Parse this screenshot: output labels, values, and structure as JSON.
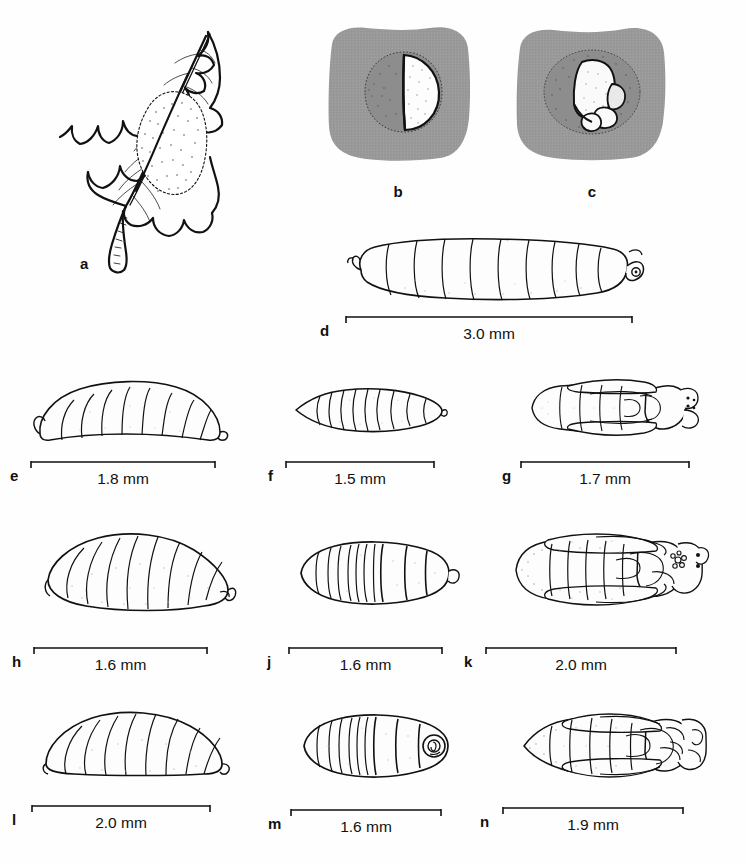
{
  "figure": {
    "kind": "scientific-illustration-plate",
    "background_color": "#fefefe",
    "ink_color": "#111111",
    "halftone_gray": "#9a9a9a"
  },
  "panels": [
    {
      "id": "a",
      "label": "a",
      "caption": "",
      "scale": null,
      "subject": "holly leaf with blotch mine",
      "has_gray_field": false
    },
    {
      "id": "b",
      "label": "b",
      "caption": "",
      "scale": null,
      "subject": "egg in leaf tissue",
      "has_gray_field": true
    },
    {
      "id": "c",
      "label": "c",
      "caption": "",
      "scale": null,
      "subject": "egg with parasitoid egg in leaf tissue",
      "has_gray_field": true
    },
    {
      "id": "d",
      "label": "d",
      "caption": "",
      "scale": "3.0 mm",
      "subject": "mature larva, lateral view",
      "has_gray_field": false
    },
    {
      "id": "e",
      "label": "e",
      "caption": "",
      "scale": "1.8 mm",
      "subject": "larva, lateral view",
      "has_gray_field": false
    },
    {
      "id": "f",
      "label": "f",
      "caption": "",
      "scale": "1.5 mm",
      "subject": "larva, dorsal view",
      "has_gray_field": false
    },
    {
      "id": "g",
      "label": "g",
      "caption": "",
      "scale": "1.7 mm",
      "subject": "pupa, ventral view",
      "has_gray_field": false
    },
    {
      "id": "h",
      "label": "h",
      "caption": "",
      "scale": "1.6 mm",
      "subject": "larva, lateral view",
      "has_gray_field": false
    },
    {
      "id": "j",
      "label": "j",
      "caption": "",
      "scale": "1.6 mm",
      "subject": "larva, dorsal view",
      "has_gray_field": false
    },
    {
      "id": "k",
      "label": "k",
      "caption": "",
      "scale": "2.0 mm",
      "subject": "pupa, ventral view",
      "has_gray_field": false
    },
    {
      "id": "l",
      "label": "l",
      "caption": "",
      "scale": "2.0 mm",
      "subject": "larva, lateral view",
      "has_gray_field": false
    },
    {
      "id": "m",
      "label": "m",
      "caption": "",
      "scale": "1.6 mm",
      "subject": "larva, dorsal view",
      "has_gray_field": false
    },
    {
      "id": "n",
      "label": "n",
      "caption": "",
      "scale": "1.9 mm",
      "subject": "pupa, ventral view",
      "has_gray_field": false
    }
  ]
}
